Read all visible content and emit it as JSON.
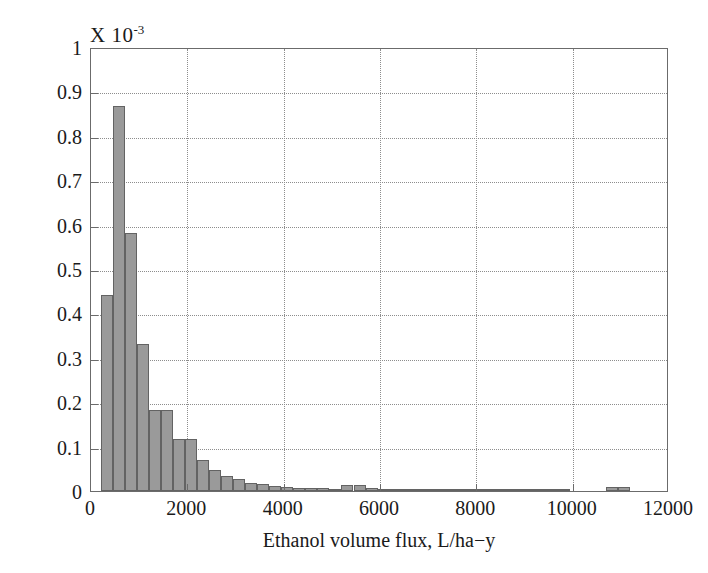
{
  "chart_data": {
    "type": "bar",
    "title": "",
    "subtitle": "",
    "exponent_prefix": "X 10",
    "exponent_power": "-3",
    "xlabel": "Ethanol volume flux, L/ha−y",
    "ylabel": "Probability distribution function",
    "xlim": [
      0,
      12000
    ],
    "ylim": [
      0,
      1
    ],
    "xticks": [
      0,
      2000,
      4000,
      6000,
      8000,
      10000,
      12000
    ],
    "xtick_labels": [
      "0",
      "2000",
      "4000",
      "6000",
      "8000",
      "10000",
      "12000"
    ],
    "yticks": [
      0,
      0.1,
      0.2,
      0.3,
      0.4,
      0.5,
      0.6,
      0.7,
      0.8,
      0.9,
      1
    ],
    "ytick_labels": [
      "0",
      "0.1",
      "0.2",
      "0.3",
      "0.4",
      "0.5",
      "0.6",
      "0.7",
      "0.8",
      "0.9",
      "1"
    ],
    "grid": true,
    "legend": null,
    "bar_color": "#9a9a9a",
    "bar_edge_color": "#636363",
    "axis_color": "#6b6b6b",
    "grid_color": "#8d8d8d",
    "bin_width": 250,
    "value_scale": "1e-3",
    "bars": [
      {
        "x0": 200,
        "x1": 450,
        "value": 0.441
      },
      {
        "x0": 450,
        "x1": 700,
        "value": 0.868
      },
      {
        "x0": 700,
        "x1": 950,
        "value": 0.58
      },
      {
        "x0": 950,
        "x1": 1200,
        "value": 0.331
      },
      {
        "x0": 1200,
        "x1": 1450,
        "value": 0.183
      },
      {
        "x0": 1450,
        "x1": 1700,
        "value": 0.183
      },
      {
        "x0": 1700,
        "x1": 1950,
        "value": 0.118
      },
      {
        "x0": 1950,
        "x1": 2200,
        "value": 0.118
      },
      {
        "x0": 2200,
        "x1": 2450,
        "value": 0.069
      },
      {
        "x0": 2450,
        "x1": 2700,
        "value": 0.048
      },
      {
        "x0": 2700,
        "x1": 2950,
        "value": 0.034
      },
      {
        "x0": 2950,
        "x1": 3200,
        "value": 0.026
      },
      {
        "x0": 3200,
        "x1": 3450,
        "value": 0.018
      },
      {
        "x0": 3450,
        "x1": 3700,
        "value": 0.015
      },
      {
        "x0": 3700,
        "x1": 3950,
        "value": 0.011
      },
      {
        "x0": 3950,
        "x1": 4200,
        "value": 0.01
      },
      {
        "x0": 4200,
        "x1": 4450,
        "value": 0.007
      },
      {
        "x0": 4450,
        "x1": 4700,
        "value": 0.006
      },
      {
        "x0": 4700,
        "x1": 4950,
        "value": 0.006
      },
      {
        "x0": 4950,
        "x1": 5200,
        "value": 0.005
      },
      {
        "x0": 5200,
        "x1": 5450,
        "value": 0.013
      },
      {
        "x0": 5450,
        "x1": 5700,
        "value": 0.013
      },
      {
        "x0": 5700,
        "x1": 5950,
        "value": 0.006
      },
      {
        "x0": 5950,
        "x1": 6200,
        "value": 0.004
      },
      {
        "x0": 6200,
        "x1": 6450,
        "value": 0.005
      },
      {
        "x0": 6450,
        "x1": 6700,
        "value": 0.004
      },
      {
        "x0": 6700,
        "x1": 6950,
        "value": 0.004
      },
      {
        "x0": 6950,
        "x1": 7200,
        "value": 0.005
      },
      {
        "x0": 7200,
        "x1": 7450,
        "value": 0.004
      },
      {
        "x0": 7450,
        "x1": 7700,
        "value": 0.004
      },
      {
        "x0": 7700,
        "x1": 7950,
        "value": 0.005
      },
      {
        "x0": 7950,
        "x1": 8200,
        "value": 0.004
      },
      {
        "x0": 8200,
        "x1": 8450,
        "value": 0.005
      },
      {
        "x0": 8450,
        "x1": 8700,
        "value": 0.003
      },
      {
        "x0": 8700,
        "x1": 8950,
        "value": 0.003
      },
      {
        "x0": 8950,
        "x1": 9200,
        "value": 0.004
      },
      {
        "x0": 9200,
        "x1": 9450,
        "value": 0.003
      },
      {
        "x0": 9450,
        "x1": 9700,
        "value": 0.003
      },
      {
        "x0": 9700,
        "x1": 9950,
        "value": 0.003
      },
      {
        "x0": 10700,
        "x1": 10950,
        "value": 0.01
      },
      {
        "x0": 10950,
        "x1": 11200,
        "value": 0.01
      }
    ]
  }
}
